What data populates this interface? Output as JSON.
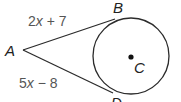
{
  "diagram": {
    "type": "tangent-segments-to-circle",
    "points": {
      "A": {
        "label": "A",
        "x": 22,
        "y": 50
      },
      "B": {
        "label": "B",
        "x": 113,
        "y": 19
      },
      "D": {
        "label": "D",
        "x": 113,
        "y": 93
      },
      "C": {
        "label": "C",
        "x": 131,
        "y": 56
      }
    },
    "circle": {
      "center": "C",
      "cx": 131,
      "cy": 56,
      "r": 38
    },
    "segments": [
      {
        "from": "A",
        "to": "B",
        "label_coef": "2",
        "label_var": "x",
        "label_rest": " + 7",
        "label_full": "2x + 7"
      },
      {
        "from": "A",
        "to": "D",
        "label_coef": "5",
        "label_var": "x",
        "label_rest": " − 8",
        "label_full": "5x − 8"
      }
    ],
    "colors": {
      "stroke": "#2b2b2b",
      "label": "#555555",
      "point_label": "#222222",
      "background": "#ffffff"
    }
  }
}
